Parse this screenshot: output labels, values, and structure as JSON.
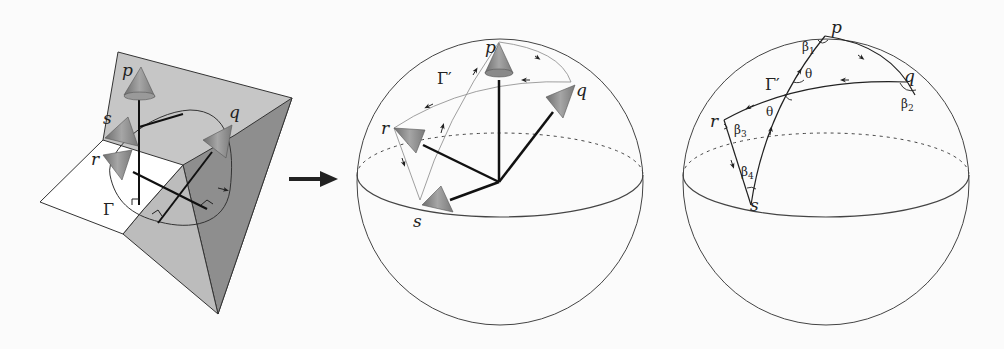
{
  "figure": {
    "panels": [
      {
        "id": "surface-panel",
        "description": "Surface with normal vectors (cones) at points p, q, r, s along closed curve Gamma",
        "labels": {
          "p": "p",
          "q": "q",
          "r": "r",
          "s": "s",
          "curve": "Γ"
        }
      },
      {
        "id": "gauss-map-sphere-panel",
        "description": "Normals translated to origin of unit sphere; image curve Gamma prime",
        "labels": {
          "p": "p",
          "q": "q",
          "r": "r",
          "s": "s",
          "curve": "Γ′"
        }
      },
      {
        "id": "spherical-polygon-panel",
        "description": "Spherical polygon traced by Gamma prime with angles",
        "labels": {
          "p": "p",
          "q": "q",
          "r": "r",
          "s": "s",
          "curve": "Γ′",
          "beta1": "β",
          "beta1_sub": "1",
          "beta2": "β",
          "beta2_sub": "2",
          "beta3": "β",
          "beta3_sub": "3",
          "beta4": "β",
          "beta4_sub": "4",
          "theta_upper": "θ",
          "theta_lower": "θ"
        }
      }
    ],
    "colors": {
      "background": "#fbfbfb",
      "plane_light": "#c4c4c4",
      "plane_dark": "#8f8f8f",
      "plane_white": "#ffffff",
      "cone": "#8a8a8a",
      "line": "#222222"
    }
  }
}
